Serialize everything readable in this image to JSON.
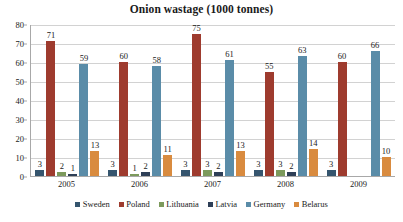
{
  "chart_data": {
    "type": "bar",
    "title": "Onion wastage (1000 tonnes)",
    "xlabel": "",
    "ylabel": "",
    "ylim": [
      0,
      80
    ],
    "yticks": [
      0,
      10,
      20,
      30,
      40,
      50,
      60,
      70,
      80
    ],
    "grid": true,
    "legend_position": "bottom",
    "categories": [
      "2005",
      "2006",
      "2007",
      "2008",
      "2009"
    ],
    "series": [
      {
        "name": "Sweden",
        "color": "#35556E",
        "values": [
          3,
          3,
          3,
          3,
          3
        ]
      },
      {
        "name": "Poland",
        "color": "#9E3B2E",
        "values": [
          71,
          60,
          75,
          55,
          60
        ]
      },
      {
        "name": "Lithuania",
        "color": "#7C9A5C",
        "values": [
          2,
          1,
          3,
          3,
          null
        ]
      },
      {
        "name": "Latvia",
        "color": "#2E3F57",
        "values": [
          1,
          2,
          2,
          2,
          null
        ]
      },
      {
        "name": "Germany",
        "color": "#5A8CA8",
        "values": [
          59,
          58,
          61,
          63,
          66
        ]
      },
      {
        "name": "Belarus",
        "color": "#D98B3F",
        "values": [
          13,
          11,
          13,
          14,
          10
        ]
      }
    ]
  }
}
